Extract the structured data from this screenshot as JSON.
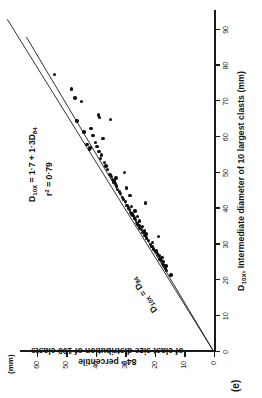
{
  "figure": {
    "panel_label": "(e)",
    "y_unit": "(mm)",
    "x_unit_in_label": "(mm)"
  },
  "annotations": {
    "regression_eq_line1": "D10X = 1·7 + 1·3D84",
    "regression_eq_line2": "r2 = 0·79",
    "identity_line_label": "D10X = D84"
  },
  "chart_data": {
    "type": "scatter",
    "title": "",
    "xlabel": "D10X, Intermediate diameter of 10 largest clasts (mm)",
    "ylabel": "84th percentile of clast size distribution of 100 clasts",
    "xlim": [
      0,
      95
    ],
    "ylim": [
      0,
      65
    ],
    "grid": false,
    "legend": "none",
    "xticks": [
      0,
      10,
      20,
      30,
      40,
      50,
      60,
      70,
      80,
      90
    ],
    "yticks": [
      0,
      10,
      20,
      30,
      40,
      50,
      60
    ],
    "xtick_labels": [
      "0",
      "10",
      "20",
      "30",
      "40",
      "50",
      "60",
      "70",
      "80",
      "90"
    ],
    "ytick_labels": [
      "0",
      "10",
      "20",
      "30",
      "40",
      "50",
      "60"
    ],
    "series": [
      {
        "name": "clast size observations",
        "marker": "filled-circle",
        "color": "#0d0d0d",
        "points": [
          [
            21.5,
            14.5
          ],
          [
            22.8,
            16.0
          ],
          [
            23.5,
            16.5
          ],
          [
            24.0,
            16.2
          ],
          [
            24.3,
            17.0
          ],
          [
            24.8,
            17.4
          ],
          [
            25.2,
            17.0
          ],
          [
            25.6,
            17.8
          ],
          [
            26.0,
            18.3
          ],
          [
            26.4,
            17.6
          ],
          [
            27.0,
            18.6
          ],
          [
            27.5,
            19.2
          ],
          [
            28.2,
            19.6
          ],
          [
            28.8,
            20.4
          ],
          [
            29.4,
            21.0
          ],
          [
            30.0,
            21.6
          ],
          [
            30.6,
            20.8
          ],
          [
            31.2,
            22.2
          ],
          [
            31.8,
            22.8
          ],
          [
            32.2,
            18.8
          ],
          [
            32.6,
            23.4
          ],
          [
            33.0,
            23.0
          ],
          [
            33.4,
            24.0
          ],
          [
            33.8,
            23.6
          ],
          [
            34.2,
            24.6
          ],
          [
            34.6,
            25.0
          ],
          [
            35.0,
            24.2
          ],
          [
            35.4,
            25.4
          ],
          [
            35.8,
            25.8
          ],
          [
            36.2,
            26.2
          ],
          [
            36.6,
            25.2
          ],
          [
            37.0,
            26.6
          ],
          [
            37.4,
            27.0
          ],
          [
            37.8,
            26.0
          ],
          [
            38.2,
            27.4
          ],
          [
            38.6,
            27.8
          ],
          [
            39.0,
            28.2
          ],
          [
            39.4,
            26.8
          ],
          [
            39.8,
            28.6
          ],
          [
            40.2,
            29.0
          ],
          [
            40.6,
            28.0
          ],
          [
            41.0,
            29.4
          ],
          [
            41.6,
            23.2
          ],
          [
            42.0,
            30.0
          ],
          [
            42.6,
            30.6
          ],
          [
            43.2,
            31.0
          ],
          [
            43.8,
            28.4
          ],
          [
            44.2,
            31.6
          ],
          [
            44.8,
            32.0
          ],
          [
            45.4,
            32.6
          ],
          [
            45.8,
            29.6
          ],
          [
            46.4,
            33.0
          ],
          [
            47.0,
            33.4
          ],
          [
            47.4,
            34.0
          ],
          [
            47.8,
            33.8
          ],
          [
            48.2,
            34.4
          ],
          [
            48.6,
            33.2
          ],
          [
            49.0,
            34.8
          ],
          [
            49.6,
            35.2
          ],
          [
            50.2,
            30.4
          ],
          [
            51.0,
            36.0
          ],
          [
            52.0,
            36.6
          ],
          [
            53.0,
            37.0
          ],
          [
            54.0,
            38.4
          ],
          [
            55.0,
            38.0
          ],
          [
            56.0,
            39.0
          ],
          [
            56.6,
            42.2
          ],
          [
            57.0,
            42.0
          ],
          [
            57.4,
            39.6
          ],
          [
            58.0,
            43.0
          ],
          [
            58.6,
            40.2
          ],
          [
            59.6,
            37.6
          ],
          [
            60.5,
            41.0
          ],
          [
            61.5,
            44.0
          ],
          [
            62.5,
            41.6
          ],
          [
            64.5,
            46.4
          ],
          [
            65.0,
            35.0
          ],
          [
            65.6,
            38.8
          ],
          [
            66.2,
            39.2
          ],
          [
            70.0,
            44.8
          ],
          [
            71.0,
            47.0
          ],
          [
            73.5,
            48.2
          ],
          [
            77.5,
            54.0
          ]
        ]
      }
    ],
    "lines": [
      {
        "name": "regression-line",
        "label": "D10X = 1·7 + 1·3D84",
        "from": [
          0,
          0
        ],
        "to": [
          93,
          70.0
        ],
        "style": "solid"
      },
      {
        "name": "identity-line",
        "label": "D10X = D84",
        "from": [
          0,
          0
        ],
        "to": [
          88,
          63.5
        ],
        "style": "solid"
      }
    ]
  }
}
